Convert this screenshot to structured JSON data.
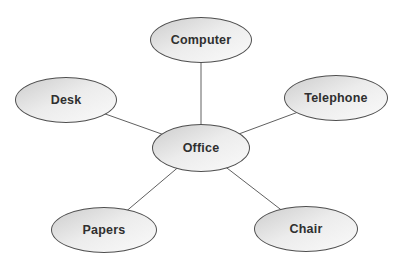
{
  "figure": {
    "type": "spider-diagram",
    "center": {
      "label": "Office"
    },
    "satellites": [
      {
        "id": "computer",
        "label": "Computer"
      },
      {
        "id": "desk",
        "label": "Desk"
      },
      {
        "id": "telephone",
        "label": "Telephone"
      },
      {
        "id": "papers",
        "label": "Papers"
      },
      {
        "id": "chair",
        "label": "Chair"
      }
    ],
    "edges": [
      {
        "from": "Office",
        "to": "Computer"
      },
      {
        "from": "Office",
        "to": "Desk"
      },
      {
        "from": "Office",
        "to": "Telephone"
      },
      {
        "from": "Office",
        "to": "Papers"
      },
      {
        "from": "Office",
        "to": "Chair"
      }
    ],
    "colors": {
      "node_fill_dark": "#cdcdcd",
      "node_fill_light": "#fafafa",
      "node_border": "#4f4f4f",
      "connector": "#606060",
      "label": "#2f2f2f",
      "background": "#ffffff"
    }
  }
}
